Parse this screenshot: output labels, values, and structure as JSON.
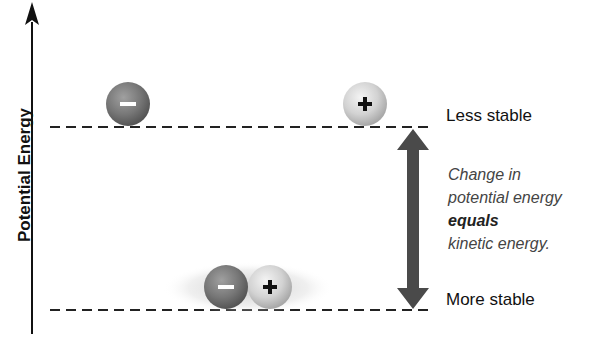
{
  "axis": {
    "label": "Potential Energy"
  },
  "levels": {
    "upper": {
      "label": "Less stable"
    },
    "lower": {
      "label": "More stable"
    }
  },
  "note": {
    "line1": "Change in",
    "line2": "potential energy",
    "line3": "equals",
    "line4": "kinetic energy."
  },
  "particles": {
    "negative_symbol": "−",
    "positive_symbol": "+"
  },
  "colors": {
    "negative_particle": "#7a7a7a",
    "positive_particle": "#d6d6d6",
    "arrow": "#4a4a4a",
    "dashed_line": "#222222"
  }
}
